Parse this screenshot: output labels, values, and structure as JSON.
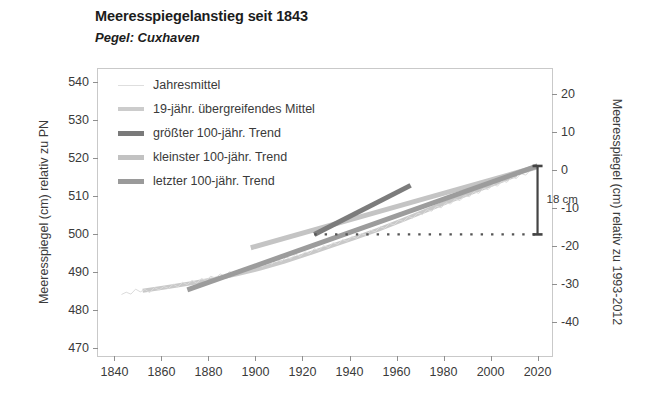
{
  "header": {
    "title": "Meeresspiegelanstieg seit 1843",
    "subtitle": "Pegel: Cuxhaven"
  },
  "chart_data": {
    "type": "line",
    "title": "Meeresspiegelanstieg seit 1843",
    "subtitle": "Pegel: Cuxhaven",
    "xlabel": "",
    "ylabel": "Meeresspiegel (cm) relativ zu PN",
    "ylabel_right": "Meeresspiegel (cm) relativ zu 1993-2012",
    "xlim": [
      1833,
      2027
    ],
    "ylim": [
      467.5,
      543.5
    ],
    "ylim_right": [
      -49.5,
      26.5
    ],
    "grid": false,
    "legend_position": "upper-left",
    "xticks": [
      1840,
      1860,
      1880,
      1900,
      1920,
      1940,
      1960,
      1980,
      2000,
      2020
    ],
    "yticks_left": [
      470,
      480,
      490,
      500,
      510,
      520,
      530,
      540
    ],
    "yticks_right": [
      -40,
      -30,
      -20,
      -10,
      0,
      10,
      20
    ],
    "right_axis_zero_at_left_value": 517,
    "legend": [
      {
        "label": "Jahresmittel",
        "color": "#dedede",
        "width": 1
      },
      {
        "label": "19-jähr. übergreifendes Mittel",
        "color": "#cccccc",
        "width": 4
      },
      {
        "label": "größter 100-jähr. Trend",
        "color": "#7a7a7a",
        "width": 5
      },
      {
        "label": "kleinster 100-jähr. Trend",
        "color": "#c2c2c2",
        "width": 5
      },
      {
        "label": "letzter 100-jähr. Trend",
        "color": "#9a9a9a",
        "width": 5
      }
    ],
    "series": [
      {
        "name": "Jahresmittel",
        "type": "line",
        "color": "#dcdcdc",
        "width": 1,
        "x": [
          1843,
          1845,
          1847,
          1849,
          1851,
          1853,
          1855,
          1857,
          1859,
          1861,
          1863,
          1865,
          1867,
          1869,
          1871,
          1873,
          1875,
          1877,
          1879,
          1881,
          1883,
          1885,
          1887,
          1889,
          1891,
          1893,
          1895,
          1897,
          1899,
          1901,
          1903,
          1905,
          1907,
          1909,
          1911,
          1913,
          1915,
          1917,
          1919,
          1921,
          1923,
          1925,
          1927,
          1929,
          1931,
          1933,
          1935,
          1937,
          1939,
          1941,
          1943,
          1945,
          1947,
          1949,
          1951,
          1953,
          1955,
          1957,
          1959,
          1961,
          1963,
          1965,
          1967,
          1969,
          1971,
          1973,
          1975,
          1977,
          1979,
          1981,
          1983,
          1985,
          1987,
          1989,
          1991,
          1993,
          1995,
          1997,
          1999,
          2001,
          2003,
          2005,
          2007,
          2009,
          2011,
          2013,
          2015,
          2017,
          2019,
          2020
        ],
        "y": [
          484.2,
          484.8,
          484.3,
          485.6,
          484.9,
          485.5,
          484.7,
          486.0,
          485.4,
          486.3,
          485.8,
          486.9,
          486.2,
          487.4,
          486.8,
          487.9,
          487.2,
          488.4,
          487.9,
          489.0,
          488.5,
          489.6,
          489.0,
          490.2,
          489.6,
          490.8,
          490.2,
          491.4,
          490.9,
          492.0,
          491.5,
          492.7,
          492.2,
          493.4,
          492.9,
          494.0,
          493.6,
          494.8,
          494.2,
          495.4,
          495.0,
          496.2,
          495.8,
          497.0,
          496.6,
          497.8,
          497.4,
          498.6,
          498.2,
          499.4,
          499.0,
          500.2,
          499.8,
          501.1,
          500.7,
          502.0,
          501.6,
          502.9,
          502.5,
          503.8,
          503.4,
          504.7,
          504.3,
          505.6,
          505.2,
          506.5,
          506.1,
          507.4,
          507.0,
          508.3,
          508.0,
          509.3,
          508.9,
          510.2,
          509.9,
          511.2,
          510.8,
          512.1,
          511.8,
          513.1,
          512.7,
          514.1,
          513.7,
          515.1,
          514.7,
          516.0,
          515.6,
          516.9,
          517.4,
          517.9
        ]
      },
      {
        "name": "19-jähr. übergreifendes Mittel",
        "type": "line",
        "color": "#c9c9c9",
        "width": 4,
        "x": [
          1852,
          1862,
          1872,
          1882,
          1892,
          1902,
          1912,
          1922,
          1932,
          1942,
          1952,
          1962,
          1972,
          1982,
          1992,
          2002,
          2011
        ],
        "y": [
          485.2,
          486.1,
          487.1,
          488.2,
          489.5,
          491.0,
          492.8,
          494.8,
          496.9,
          499.0,
          501.2,
          503.6,
          506.1,
          508.6,
          511.0,
          513.4,
          515.6
        ]
      },
      {
        "name": "größter 100-jähr. Trend",
        "type": "trend",
        "color": "#7c7c7c",
        "width": 5,
        "x": [
          1925,
          1966
        ],
        "y": [
          500.0,
          512.9
        ]
      },
      {
        "name": "kleinster 100-jähr. Trend",
        "type": "trend",
        "color": "#c4c4c4",
        "width": 5,
        "x": [
          1898,
          2020
        ],
        "y": [
          496.5,
          517.8
        ]
      },
      {
        "name": "letzter 100-jähr. Trend",
        "type": "trend",
        "color": "#9c9c9c",
        "width": 5,
        "x": [
          1871,
          2020
        ],
        "y": [
          485.4,
          518.0
        ]
      }
    ],
    "reference_line": {
      "name": "Referenzlinie 500 cm",
      "style": "dotted",
      "color": "#555555",
      "y": 500,
      "x_start": 1925,
      "x_end": 2020
    },
    "annotation": {
      "label": "18 cm",
      "x": 2020,
      "y_bottom": 500,
      "y_top": 518,
      "color": "#444444"
    }
  }
}
